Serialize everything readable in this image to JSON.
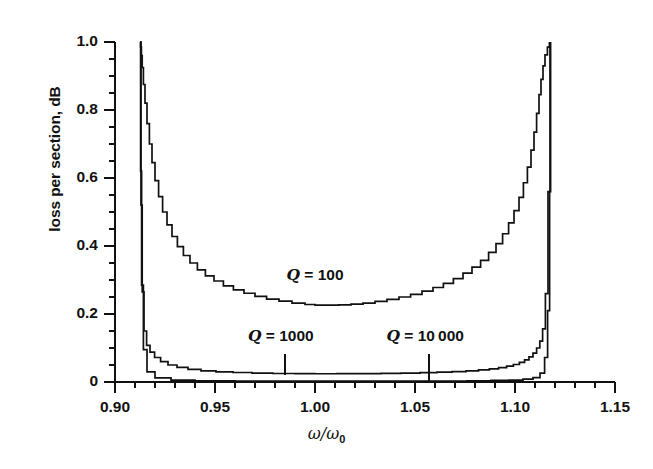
{
  "chart_data": {
    "type": "line",
    "title": "",
    "xlabel": "ω/ω₀",
    "ylabel": "loss per section, dB",
    "xlim": [
      0.9,
      1.15
    ],
    "ylim": [
      0.0,
      1.0
    ],
    "grid": false,
    "legend_position": "inline-annotations",
    "xticks": [
      "0.90",
      "0.95",
      "1.00",
      "1.05",
      "1.10",
      "1.15"
    ],
    "xtick_values": [
      0.9,
      0.95,
      1.0,
      1.05,
      1.1,
      1.15
    ],
    "xminor_interval": 0.01,
    "yticks": [
      "0",
      "0.2",
      "0.4",
      "0.6",
      "0.8",
      "1.0"
    ],
    "ytick_values": [
      0.0,
      0.2,
      0.4,
      0.6,
      0.8,
      1.0
    ],
    "yminor_interval": 0.05,
    "passband": [
      0.9125,
      1.1175
    ],
    "annotations": [
      {
        "text_prefix": "Q",
        "text_rest": " = 100",
        "x": 1.0,
        "y": 0.315,
        "leader": false
      },
      {
        "text_prefix": "Q",
        "text_rest": " = 1000",
        "x": 0.983,
        "y": 0.135,
        "leader": true,
        "leader_x": 0.985,
        "leader_y_top": 0.082,
        "leader_y_bottom": 0.022
      },
      {
        "text_prefix": "Q",
        "text_rest": " = 10 000",
        "x": 1.055,
        "y": 0.135,
        "leader": true,
        "leader_x": 1.057,
        "leader_y_top": 0.082,
        "leader_y_bottom": 0.0
      }
    ],
    "series": [
      {
        "name": "Q = 100",
        "q": 100,
        "x": [
          0.9125,
          0.9128,
          0.9132,
          0.9136,
          0.9142,
          0.915,
          0.916,
          0.9172,
          0.9185,
          0.92,
          0.9218,
          0.9238,
          0.926,
          0.9285,
          0.9312,
          0.9342,
          0.9375,
          0.9412,
          0.9452,
          0.9495,
          0.9542,
          0.9592,
          0.9645,
          0.97,
          0.9758,
          0.982,
          0.9885,
          0.995,
          1.0,
          1.006,
          1.012,
          1.018,
          1.024,
          1.03,
          1.036,
          1.042,
          1.0478,
          1.0535,
          1.059,
          1.0642,
          1.0692,
          1.074,
          1.0785,
          1.0828,
          1.0868,
          1.0905,
          1.0938,
          1.0968,
          1.0995,
          1.102,
          1.1042,
          1.1062,
          1.108,
          1.1095,
          1.1108,
          1.112,
          1.113,
          1.114,
          1.115,
          1.1162,
          1.1172
        ],
        "y": [
          1.0,
          0.985,
          0.96,
          0.925,
          0.875,
          0.82,
          0.76,
          0.7,
          0.645,
          0.592,
          0.545,
          0.5,
          0.462,
          0.428,
          0.398,
          0.372,
          0.35,
          0.33,
          0.312,
          0.297,
          0.283,
          0.271,
          0.261,
          0.252,
          0.244,
          0.238,
          0.232,
          0.228,
          0.226,
          0.226,
          0.227,
          0.229,
          0.232,
          0.237,
          0.243,
          0.25,
          0.258,
          0.267,
          0.278,
          0.29,
          0.304,
          0.32,
          0.338,
          0.358,
          0.381,
          0.407,
          0.436,
          0.468,
          0.504,
          0.543,
          0.586,
          0.632,
          0.682,
          0.735,
          0.79,
          0.845,
          0.89,
          0.93,
          0.962,
          0.985,
          1.0
        ]
      },
      {
        "name": "Q = 1000",
        "q": 1000,
        "x": [
          0.9125,
          0.913,
          0.9136,
          0.9145,
          0.9158,
          0.9175,
          0.9198,
          0.9228,
          0.9265,
          0.931,
          0.9365,
          0.943,
          0.9505,
          0.959,
          0.9685,
          0.979,
          0.99,
          1.0,
          1.011,
          1.022,
          1.033,
          1.043,
          1.0525,
          1.061,
          1.0685,
          1.0755,
          1.0818,
          1.0872,
          1.0918,
          1.0958,
          1.0992,
          1.1022,
          1.1048,
          1.107,
          1.109,
          1.1108,
          1.1124,
          1.1138,
          1.1152,
          1.1165,
          1.1175
        ],
        "y": [
          1.0,
          0.52,
          0.265,
          0.15,
          0.108,
          0.088,
          0.072,
          0.06,
          0.05,
          0.043,
          0.037,
          0.033,
          0.03,
          0.028,
          0.026,
          0.025,
          0.0245,
          0.0243,
          0.0244,
          0.0247,
          0.0252,
          0.0262,
          0.0274,
          0.0289,
          0.0308,
          0.033,
          0.0356,
          0.0388,
          0.0424,
          0.0466,
          0.0515,
          0.0575,
          0.0648,
          0.0738,
          0.0852,
          0.1,
          0.12,
          0.156,
          0.26,
          0.56,
          1.0
        ]
      },
      {
        "name": "Q = 10 000",
        "q": 10000,
        "x": [
          0.9125,
          0.9128,
          0.9133,
          0.9142,
          0.916,
          0.92,
          0.928,
          0.94,
          0.96,
          0.98,
          1.0,
          1.02,
          1.04,
          1.06,
          1.076,
          1.088,
          1.097,
          1.104,
          1.109,
          1.1125,
          1.1148,
          1.1163,
          1.1173,
          1.1178
        ],
        "y": [
          1.0,
          0.62,
          0.285,
          0.095,
          0.03,
          0.012,
          0.0055,
          0.0035,
          0.0027,
          0.0024,
          0.0023,
          0.0024,
          0.0026,
          0.003,
          0.0036,
          0.0045,
          0.0058,
          0.0082,
          0.013,
          0.026,
          0.072,
          0.21,
          0.56,
          1.0
        ]
      }
    ]
  }
}
